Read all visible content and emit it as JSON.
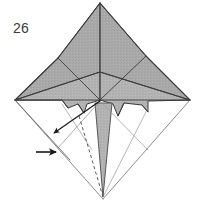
{
  "diagram": {
    "step_number": "26",
    "colors": {
      "paper_front": "#a8a8a8",
      "paper_front_light": "#b4b4b4",
      "paper_back": "#ffffff",
      "outline": "#3a3a3a",
      "crease_line": "#555555",
      "thin_edge": "#8a8a8a",
      "arrow": "#1a1a1a",
      "background": "#ffffff",
      "step_text": "#3b3b3b"
    },
    "geometry": {
      "apex_top": [
        100,
        3
      ],
      "vertex_left": [
        15,
        100
      ],
      "vertex_right": [
        190,
        100
      ],
      "vertex_bottom": [
        103,
        199
      ],
      "center_hub": [
        100,
        100
      ],
      "upper_junction": [
        100,
        72
      ],
      "left_wing_tip": [
        15,
        100
      ],
      "right_wing_tip": [
        190,
        100
      ]
    },
    "shapes": [
      {
        "name": "upper-left-gray-flap",
        "fill": "paper_front"
      },
      {
        "name": "upper-right-gray-flap",
        "fill": "paper_front"
      },
      {
        "name": "left-wing-gray-flap",
        "fill": "paper_front_light"
      },
      {
        "name": "right-wing-gray-flap",
        "fill": "paper_front_light"
      },
      {
        "name": "center-lower-gray-spike",
        "fill": "paper_front_light"
      },
      {
        "name": "lower-white-panel",
        "fill": "paper_back"
      }
    ],
    "arrows": [
      {
        "name": "fold-arrow-diagonal",
        "direction": "down-left",
        "tail": [
          100,
          101
        ],
        "head": [
          52,
          134
        ],
        "style": "solid-filled-head"
      },
      {
        "name": "fold-arrow-horizontal",
        "direction": "right",
        "tail": [
          38,
          152
        ],
        "head": [
          58,
          152
        ],
        "style": "solid-filled-head"
      }
    ],
    "fold_lines": [
      {
        "name": "valley-fold-dashed",
        "style": "dashed",
        "from": [
          79,
          116
        ],
        "to": [
          103,
          197
        ]
      }
    ]
  }
}
